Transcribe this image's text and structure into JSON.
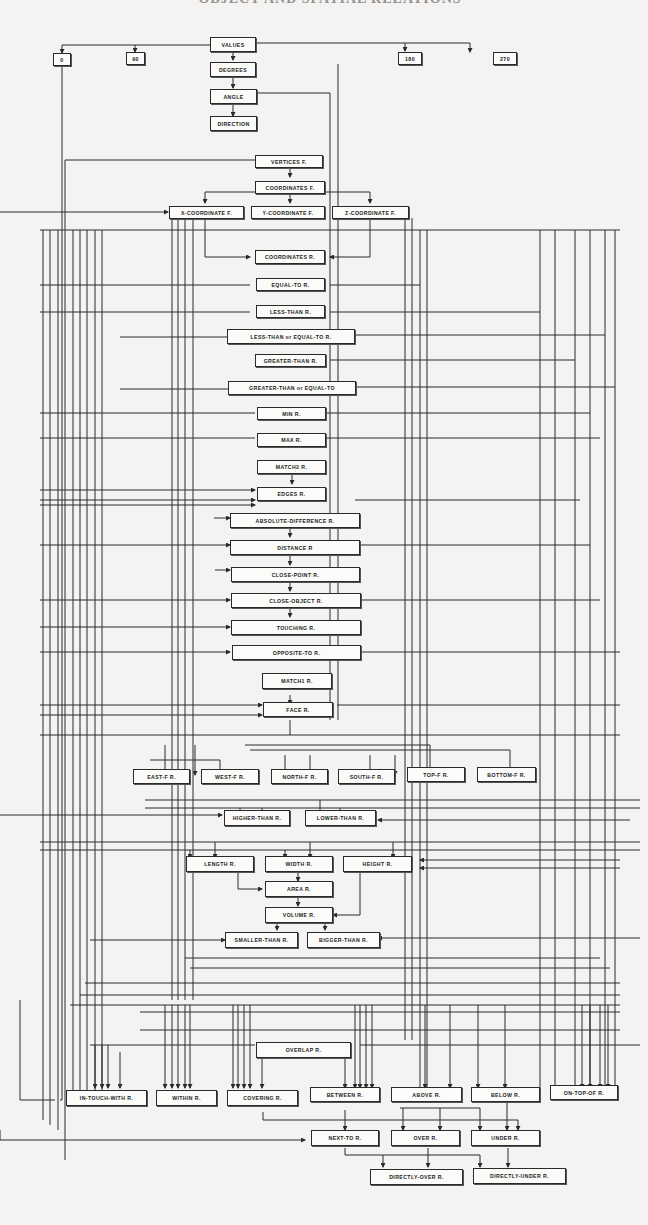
{
  "title": "OBJECT AND SPATIAL RELATIONS",
  "colors": {
    "background": "#f4f3f1",
    "line": "#2a2a2a",
    "box_fill": "#fbfbf9"
  },
  "nodes": {
    "values": "VALUES",
    "v0": "0",
    "v90": "90",
    "v180": "180",
    "v270": "270",
    "degrees": "DEGREES",
    "angle": "ANGLE",
    "direction": "DIRECTION",
    "vertices_f": "VERTICES F.",
    "coordinates_f": "COORDINATES F.",
    "x_coordinate_f": "X-COORDINATE F.",
    "y_coordinate_f": "Y-COORDINATE F.",
    "z_coordinate_f": "Z-COORDINATE F.",
    "coordinates_r": "COORDINATES R.",
    "equal_to_r": "EQUAL-TO R.",
    "less_than_r": "LESS-THAN R.",
    "less_than_or_equal_to_r": "LESS-THAN or EQUAL-TO R.",
    "greater_than_r": "GREATER-THAN R.",
    "greater_than_or_equal_to": "GREATER-THAN or EQUAL-TO",
    "min_r": "MIN R.",
    "max_r": "MAX R.",
    "match2_r": "MATCH2 R.",
    "edges_r": "EDGES R.",
    "absolute_difference_r": "ABSOLUTE-DIFFERENCE R.",
    "distance_r": "DISTANCE R",
    "close_point_r": "CLOSE-POINT R.",
    "close_object_r": "CLOSE-OBJECT R.",
    "touching_r": "TOUCHING R.",
    "opposite_to_r": "OPPOSITE-TO R.",
    "match1_r": "MATCH1 R.",
    "face_r": "FACE R.",
    "east_f_r": "EAST-F R.",
    "west_f_r": "WEST-F R.",
    "north_f_r": "NORTH-F R.",
    "south_f_r": "SOUTH-F R.",
    "top_f_r": "TOP-F R.",
    "bottom_f_r": "BOTTOM-F R.",
    "higher_than_r": "HIGHER-THAN R.",
    "lower_than_r": "LOWER-THAN R.",
    "length_r": "LENGTH R.",
    "width_r": "WIDTH R.",
    "height_r": "HEIGHT R.",
    "area_r": "AREA R.",
    "volume_r": "VOLUME R.",
    "smaller_than_r": "SMALLER-THAN R.",
    "bigger_than_r": "BIGGER-THAN R.",
    "overlap_r": "OVERLAP R.",
    "in_touch_with_r": "IN-TOUCH-WITH R.",
    "within_r": "WITHIN R.",
    "covering_r": "COVERING R.",
    "between_r": "BETWEEN R.",
    "above_r": "ABOVE R.",
    "below_r": "BELOW R.",
    "on_top_of_r": "ON-TOP-OF R.",
    "next_to_r": "NEXT-TO R.",
    "over_r": "OVER R.",
    "under_r": "UNDER R.",
    "directly_over_r": "DIRECTLY-OVER R.",
    "directly_under_r": "DIRECTLY-UNDER R."
  }
}
